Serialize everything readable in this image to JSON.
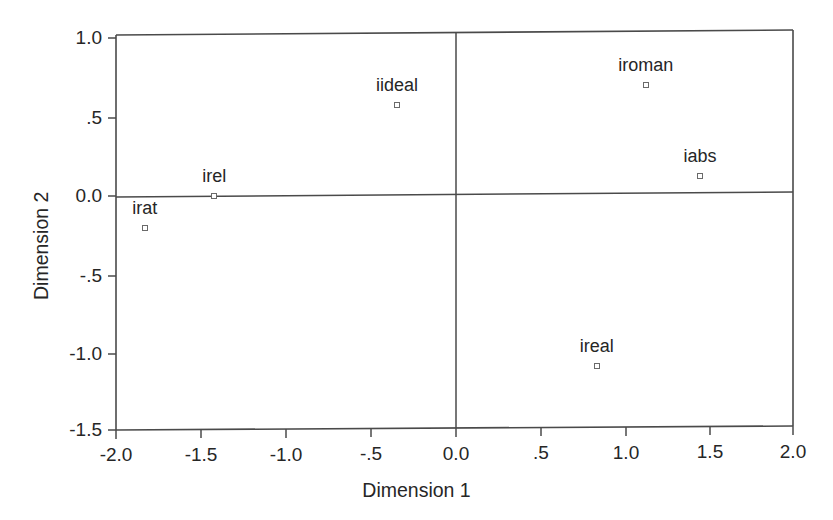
{
  "chart_data": {
    "type": "scatter",
    "title": "",
    "xlabel": "Dimension 1",
    "ylabel": "Dimension 2",
    "xlim": [
      -2.0,
      2.0
    ],
    "ylim": [
      -1.5,
      1.0
    ],
    "xticks": [
      -2.0,
      -1.5,
      -1.0,
      -0.5,
      0.0,
      0.5,
      1.0,
      1.5,
      2.0
    ],
    "xticklabels": [
      "-2.0",
      "-1.5",
      "-1.0",
      "-.5",
      "0.0",
      ".5",
      "1.0",
      "1.5",
      "2.0"
    ],
    "yticks": [
      1.0,
      0.5,
      0.0,
      -0.5,
      -1.0,
      -1.5
    ],
    "yticklabels": [
      "1.0",
      ".5",
      "0.0",
      "-.5",
      "-1.0",
      "-1.5"
    ],
    "grid": false,
    "legend": null,
    "reference_lines": {
      "vertical_at_x": 0.0,
      "horizontal_at_y": 0.0
    },
    "marker_style": "open-square",
    "points": [
      {
        "label": "irat",
        "x": -1.83,
        "y": -0.21
      },
      {
        "label": "irel",
        "x": -1.42,
        "y": -0.01
      },
      {
        "label": "iideal",
        "x": -0.34,
        "y": 0.57
      },
      {
        "label": "iroman",
        "x": 1.13,
        "y": 0.7
      },
      {
        "label": "iabs",
        "x": 1.45,
        "y": 0.12
      },
      {
        "label": "ireal",
        "x": 0.84,
        "y": -1.09
      }
    ]
  },
  "colors": {
    "axis": "#4a4a4a",
    "text": "#262626",
    "marker_stroke": "#6a6a6a",
    "background": "#ffffff"
  },
  "axes": {
    "x_title": "Dimension 1",
    "y_title": "Dimension 2"
  }
}
